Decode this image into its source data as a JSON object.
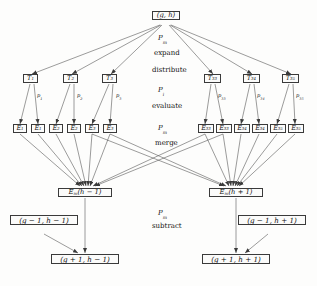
{
  "diagram": {
    "root": {
      "label": "(g, h)"
    },
    "phases": [
      {
        "id": "pm-expand",
        "symbol": "P",
        "sub": "m",
        "op": "expand"
      },
      {
        "id": "distribute",
        "symbol": "",
        "sub": "",
        "op": "distribute"
      },
      {
        "id": "pi-evaluate",
        "symbol": "P",
        "sub": "i",
        "op": "evaluate"
      },
      {
        "id": "pm-merge",
        "symbol": "P",
        "sub": "m",
        "op": "merge"
      },
      {
        "id": "pm-subtract",
        "symbol": "P",
        "sub": "m",
        "op": "subtract"
      }
    ],
    "t_nodes_left": [
      {
        "label": "T",
        "sub": "1"
      },
      {
        "label": "T",
        "sub": "2"
      },
      {
        "label": "T",
        "sub": "3"
      }
    ],
    "t_nodes_right": [
      {
        "label": "T",
        "sub": "33"
      },
      {
        "label": "T",
        "sub": "34"
      },
      {
        "label": "T",
        "sub": "35"
      }
    ],
    "p_labels_left": [
      {
        "label": "p",
        "sub": "1"
      },
      {
        "label": "p",
        "sub": "2"
      },
      {
        "label": "p",
        "sub": "3"
      }
    ],
    "p_labels_right": [
      {
        "label": "p",
        "sub": "33"
      },
      {
        "label": "p",
        "sub": "34"
      },
      {
        "label": "p",
        "sub": "35"
      }
    ],
    "e_nodes_left": [
      {
        "label": "E",
        "sub": "1"
      },
      {
        "label": "E",
        "sub": "1"
      },
      {
        "label": "E",
        "sub": "2"
      },
      {
        "label": "E",
        "sub": "2"
      },
      {
        "label": "E",
        "sub": "3"
      },
      {
        "label": "E",
        "sub": "3"
      }
    ],
    "e_nodes_right": [
      {
        "label": "E",
        "sub": "33"
      },
      {
        "label": "E",
        "sub": "33"
      },
      {
        "label": "E",
        "sub": "34"
      },
      {
        "label": "E",
        "sub": "34"
      },
      {
        "label": "E",
        "sub": "35"
      },
      {
        "label": "E",
        "sub": "35"
      }
    ],
    "merge_nodes": [
      {
        "id": "merge-left",
        "label": "E",
        "sub": "m",
        "arg": "(h − 1)"
      },
      {
        "id": "merge-right",
        "label": "E",
        "sub": "m",
        "arg": "(h + 1)"
      }
    ],
    "operand_nodes": [
      {
        "id": "operand-left",
        "label": "(g − 1, h − 1)"
      },
      {
        "id": "operand-right",
        "label": "(g − 1, h + 1)"
      }
    ],
    "result_nodes": [
      {
        "id": "result-left",
        "label": "(g + 1, h − 1)"
      },
      {
        "id": "result-right",
        "label": "(g + 1, h + 1)"
      }
    ],
    "colors": {
      "stroke": "#3a3a3a",
      "edge": "#4a4a4a",
      "text": "#111111",
      "background": "#fdfdfc",
      "node_fill": "#fbfbfa"
    }
  }
}
